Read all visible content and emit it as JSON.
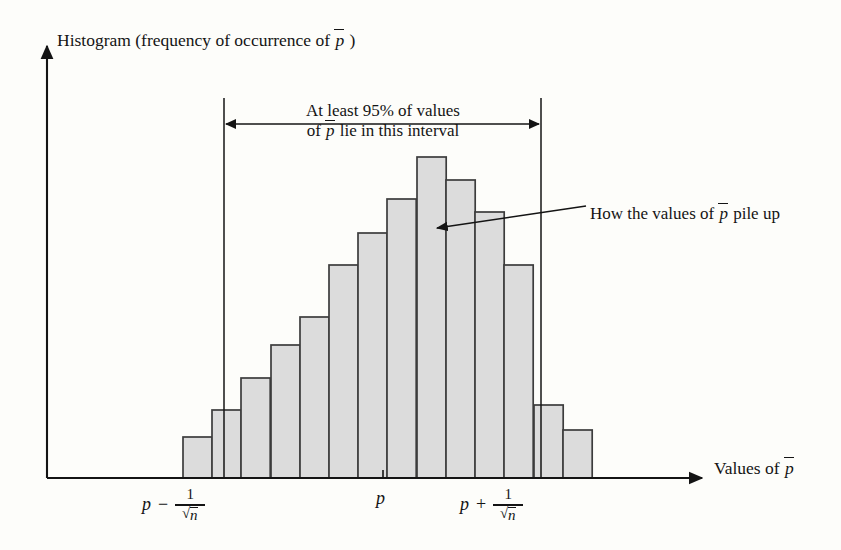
{
  "figure": {
    "kind": "histogram-diagram",
    "background_color": "#fdfdfa",
    "ink_color": "#141414",
    "bar_fill_color": "#dcdcdc",
    "bar_stroke_color": "#3c3c3c",
    "y_axis_title": "Histogram (frequency of occurrence of ",
    "y_axis_title_tail": " )",
    "x_axis_title": "Values of ",
    "p_bar_symbol": "p",
    "interval_note_line1": "At least 95% of values",
    "interval_note_line2_pre": "of ",
    "interval_note_line2_post": " lie in this interval",
    "pileup_note_pre": "How the values of ",
    "pileup_note_post": " pile up",
    "tick_center_label": "p",
    "tick_left": {
      "base": "p",
      "operator": "−",
      "numerator": "1",
      "denominator": "n"
    },
    "tick_right": {
      "base": "p",
      "operator": "+",
      "numerator": "1",
      "denominator": "n"
    }
  },
  "chart_data": {
    "type": "bar",
    "xlabel": "Values of p̄",
    "ylabel": "Histogram (frequency of occurrence of p̄)",
    "grid": false,
    "legend": "none",
    "axis_arrows": true,
    "n_bins": 14,
    "categories": [
      "1",
      "2",
      "3",
      "4",
      "5",
      "6",
      "7",
      "8",
      "9",
      "10",
      "11",
      "12",
      "13",
      "14"
    ],
    "values": [
      13,
      21,
      31,
      41,
      50,
      67,
      77,
      88,
      101,
      94,
      83,
      67,
      23,
      15
    ],
    "bar_tops_px": [
      437,
      410,
      378,
      345,
      317,
      265,
      233,
      199,
      157,
      180,
      212,
      265,
      405,
      430
    ],
    "bar_left_edges_px": [
      183,
      212,
      241,
      271,
      300,
      329,
      358,
      387,
      417,
      446,
      475,
      504,
      534,
      563
    ],
    "bar_width_px": 29.2,
    "baseline_y_px": 478,
    "peak_bin_index": 8,
    "annotations": [
      {
        "name": "interval-span",
        "text": "At least 95% of values of p̄ lie in this interval",
        "from_x_px": 224,
        "to_x_px": 541,
        "arrow_y_px": 124,
        "double_headed": true
      },
      {
        "name": "pile-up-callout",
        "text": "How the values of p̄ pile up",
        "points_to_x_px": 437,
        "points_to_y_px": 228,
        "label_x_px": 590,
        "label_y_px": 212
      }
    ],
    "reference_lines": [
      {
        "name": "lower-bound",
        "x_px": 224,
        "label": "p - 1/√n",
        "top_y_px": 98,
        "bottom_y_px": 478
      },
      {
        "name": "upper-bound",
        "x_px": 541,
        "label": "p + 1/√n",
        "top_y_px": 98,
        "bottom_y_px": 478
      }
    ],
    "x_ticks": [
      {
        "x_px": 224,
        "label": "p - 1/√n"
      },
      {
        "x_px": 383,
        "label": "p"
      },
      {
        "x_px": 541,
        "label": "p + 1/√n"
      }
    ]
  }
}
